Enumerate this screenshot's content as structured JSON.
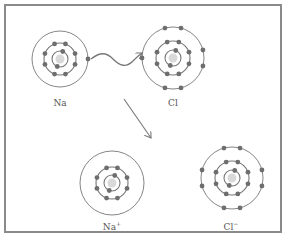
{
  "diagram": {
    "type": "ionic-bond-formation",
    "colors": {
      "frame": "#8a8a8a",
      "shell": "#777777",
      "electron": "#6e6e6e",
      "nucleus": "#d9d9d9",
      "arrow": "#777777",
      "label": "#555555"
    },
    "atoms": [
      {
        "id": "na",
        "label": "Na",
        "cx": 60,
        "cy": 59,
        "shells": [
          {
            "r": 8,
            "electrons": 2
          },
          {
            "r": 16,
            "electrons": 8
          },
          {
            "r": 28,
            "electrons": 1
          }
        ],
        "label_pos": [
          60,
          104
        ]
      },
      {
        "id": "cl",
        "label": "Cl",
        "cx": 173,
        "cy": 58,
        "shells": [
          {
            "r": 8,
            "electrons": 2
          },
          {
            "r": 17,
            "electrons": 8
          },
          {
            "r": 31,
            "electrons": 7
          }
        ],
        "label_pos": [
          173,
          104
        ]
      },
      {
        "id": "na-ion",
        "label": "Na",
        "superscript": "+",
        "cx": 112,
        "cy": 183,
        "shells": [
          {
            "r": 8,
            "electrons": 2
          },
          {
            "r": 16,
            "electrons": 8
          },
          {
            "r": 32,
            "electrons": 0
          }
        ],
        "label_pos": [
          110,
          229
        ]
      },
      {
        "id": "cl-ion",
        "label": "Cl",
        "superscript": "−",
        "cx": 232,
        "cy": 178,
        "shells": [
          {
            "r": 8,
            "electrons": 2
          },
          {
            "r": 17,
            "electrons": 8
          },
          {
            "r": 31,
            "electrons": 8
          }
        ],
        "label_pos": [
          230,
          229
        ]
      }
    ],
    "arrows": [
      {
        "id": "electron-transfer-arrow",
        "style": "wavy",
        "from": "na",
        "to": "cl"
      },
      {
        "id": "reaction-arrow",
        "style": "straight",
        "from": [
          124,
          99
        ],
        "to": [
          150,
          137
        ]
      }
    ]
  },
  "labels": {
    "na": "Na",
    "cl": "Cl",
    "na_ion": "Na",
    "na_ion_charge": "+",
    "cl_ion": "Cl",
    "cl_ion_charge": "−"
  }
}
